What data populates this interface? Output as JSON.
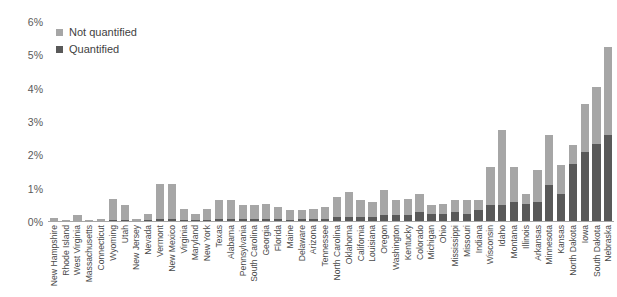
{
  "chart_data": {
    "type": "bar",
    "subtype": "stacked-bar",
    "title": "",
    "subtitle": "",
    "xlabel": "",
    "ylabel": "",
    "ylim": [
      0,
      6
    ],
    "ytick_labels": [
      "0%",
      "1%",
      "2%",
      "3%",
      "4%",
      "5%",
      "6%"
    ],
    "ytick_values": [
      0,
      1,
      2,
      3,
      4,
      5,
      6
    ],
    "grid": false,
    "legend_position": "top-left",
    "value_unit": "%",
    "categories": [
      "New Hampshire",
      "Rhode Island",
      "West Virginia",
      "Massachusetts",
      "Connecticut",
      "Wyoming",
      "Utah",
      "New Jersey",
      "Nevada",
      "Vermont",
      "New Mexico",
      "Virginia",
      "Maryland",
      "New York",
      "Texas",
      "Alabama",
      "Pennsylvania",
      "South Carolina",
      "Georgia",
      "Florida",
      "Maine",
      "Delaware",
      "Arizona",
      "Tennessee",
      "North Carolina",
      "Oklahoma",
      "California",
      "Louisiana",
      "Oregon",
      "Washington",
      "Kentucky",
      "Colorado",
      "Michigan",
      "Ohio",
      "Mississippi",
      "Missouri",
      "Indiana",
      "Wisconsin",
      "Idaho",
      "Montana",
      "Illinois",
      "Arkansas",
      "Minnesota",
      "Kansas",
      "North Dakota",
      "Iowa",
      "South Dakota",
      "Nebraska"
    ],
    "series": [
      {
        "name": "Quantified",
        "color": "#595959",
        "values": [
          0.0,
          0.0,
          0.0,
          0.0,
          0.0,
          0.05,
          0.05,
          0.0,
          0.05,
          0.1,
          0.1,
          0.05,
          0.05,
          0.05,
          0.1,
          0.1,
          0.1,
          0.1,
          0.1,
          0.1,
          0.05,
          0.1,
          0.1,
          0.1,
          0.15,
          0.15,
          0.15,
          0.15,
          0.2,
          0.2,
          0.2,
          0.3,
          0.25,
          0.25,
          0.3,
          0.25,
          0.35,
          0.5,
          0.5,
          0.6,
          0.55,
          0.6,
          1.1,
          0.85,
          1.75,
          2.1,
          2.35,
          2.6
        ]
      },
      {
        "name": "Not quantified",
        "color": "#a6a6a6",
        "values": [
          0.12,
          0.05,
          0.2,
          0.07,
          0.08,
          0.65,
          0.45,
          0.1,
          0.2,
          1.05,
          1.05,
          0.35,
          0.2,
          0.35,
          0.55,
          0.55,
          0.4,
          0.4,
          0.45,
          0.35,
          0.3,
          0.25,
          0.3,
          0.35,
          0.6,
          0.75,
          0.5,
          0.45,
          0.75,
          0.45,
          0.5,
          0.55,
          0.25,
          0.3,
          0.35,
          0.4,
          0.3,
          1.15,
          2.25,
          1.05,
          0.3,
          0.95,
          1.5,
          0.85,
          0.55,
          1.45,
          1.7,
          2.65
        ]
      }
    ],
    "totals": [
      0.12,
      0.05,
      0.2,
      0.07,
      0.08,
      0.7,
      0.5,
      0.1,
      0.25,
      1.15,
      1.15,
      0.4,
      0.25,
      0.4,
      0.65,
      0.65,
      0.5,
      0.5,
      0.55,
      0.45,
      0.35,
      0.35,
      0.4,
      0.45,
      0.75,
      0.9,
      0.65,
      0.6,
      0.95,
      0.65,
      0.7,
      0.85,
      0.5,
      0.55,
      0.65,
      0.65,
      0.65,
      1.65,
      2.75,
      1.65,
      0.85,
      1.55,
      2.6,
      1.7,
      2.3,
      3.55,
      4.05,
      5.25
    ]
  },
  "legend": {
    "items": [
      {
        "label": "Not quantified",
        "color": "#a6a6a6"
      },
      {
        "label": "Quantified",
        "color": "#595959"
      }
    ]
  },
  "colors": {
    "not_quantified": "#a6a6a6",
    "quantified": "#595959",
    "axis": "#a6a6a6",
    "text": "#595959",
    "background": "#ffffff"
  }
}
